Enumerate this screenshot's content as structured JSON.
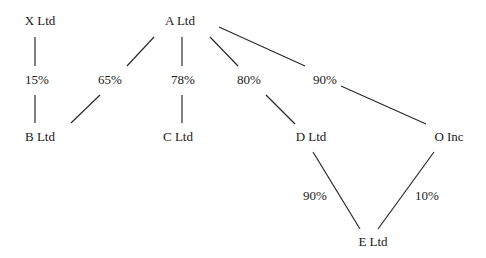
{
  "colors": {
    "line": "#2a2a2a",
    "text": "#1a1a1a",
    "background": "#ffffff"
  },
  "nodes": [
    {
      "id": "X",
      "label": "X Ltd"
    },
    {
      "id": "A",
      "label": "A Ltd"
    },
    {
      "id": "B",
      "label": "B Ltd"
    },
    {
      "id": "C",
      "label": "C Ltd"
    },
    {
      "id": "D",
      "label": "D Ltd"
    },
    {
      "id": "O",
      "label": "O Inc"
    },
    {
      "id": "E",
      "label": "E Ltd"
    }
  ],
  "edges": [
    {
      "from": "X",
      "to": "B",
      "stake": "15%"
    },
    {
      "from": "A",
      "to": "B",
      "stake": "65%"
    },
    {
      "from": "A",
      "to": "C",
      "stake": "78%"
    },
    {
      "from": "A",
      "to": "D",
      "stake": "80%"
    },
    {
      "from": "A",
      "to": "O",
      "stake": "90%"
    },
    {
      "from": "D",
      "to": "E",
      "stake": "90%"
    },
    {
      "from": "O",
      "to": "E",
      "stake": "10%"
    }
  ]
}
